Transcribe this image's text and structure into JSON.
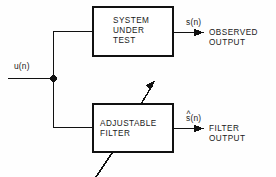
{
  "diagram": {
    "background_color": "#fefefe",
    "line_color": "#111111",
    "text_color": "#1a1a1a"
  },
  "blocks": {
    "system_under_test": {
      "line1": "SYSTEM",
      "line2": "UNDER",
      "line3": "TEST"
    },
    "adjustable_filter": {
      "line1": "ADJUSTABLE",
      "line2": "FILTER"
    }
  },
  "signals": {
    "input": "u(n)",
    "observed": "s(n)",
    "estimate_base": "s(n)",
    "estimate_hat": "^"
  },
  "outputs": {
    "observed": {
      "line1": "OBSERVED",
      "line2": "OUTPUT"
    },
    "filter": {
      "line1": "FILTER",
      "line2": "OUTPUT"
    }
  }
}
